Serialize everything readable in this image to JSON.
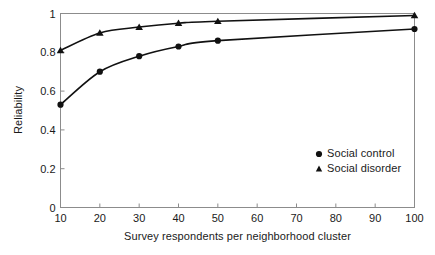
{
  "chart_data": {
    "type": "line",
    "title": "",
    "subtitle": "",
    "xlabel": "Survey respondents per neighborhood cluster",
    "ylabel": "Reliability",
    "x": [
      10,
      20,
      30,
      40,
      50,
      100
    ],
    "xlim": [
      10,
      100
    ],
    "ylim": [
      0,
      1
    ],
    "xticks": [
      10,
      20,
      30,
      40,
      50,
      60,
      70,
      80,
      90,
      100
    ],
    "xticklabels": [
      "10",
      "20",
      "30",
      "40",
      "50",
      "60",
      "70",
      "80",
      "90",
      "100"
    ],
    "yticks": [
      0,
      0.2,
      0.4,
      0.6,
      0.8,
      1
    ],
    "yticklabels": [
      "0",
      "0.2",
      "0.4",
      "0.6",
      "0.8",
      "1"
    ],
    "grid": false,
    "legend_position": "center right",
    "series": [
      {
        "name": "Social control",
        "marker": "circle",
        "color": "#111111",
        "values": [
          0.53,
          0.7,
          0.78,
          0.83,
          0.86,
          0.92
        ]
      },
      {
        "name": "Social disorder",
        "marker": "triangle",
        "color": "#111111",
        "values": [
          0.81,
          0.9,
          0.93,
          0.95,
          0.96,
          0.99
        ]
      }
    ]
  },
  "legend": {
    "items": [
      {
        "label": "Social control",
        "marker": "circle-marker"
      },
      {
        "label": "Social disorder",
        "marker": "triangle-marker"
      }
    ]
  },
  "axes": {
    "frame_color": "#8c8c8c",
    "curve_color": "#111111"
  }
}
